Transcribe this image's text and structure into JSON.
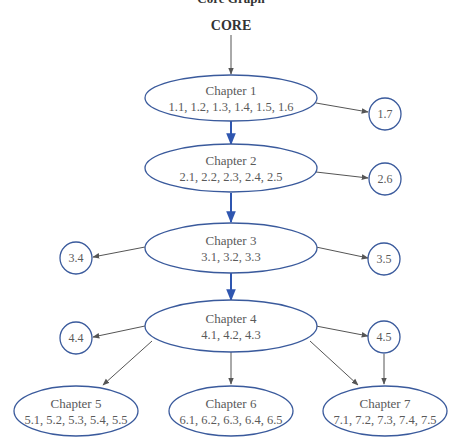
{
  "header": {
    "cutoff_title": "Core Graph",
    "core_label": "CORE"
  },
  "colors": {
    "node_stroke": "#3a5a9c",
    "core_arrow": "#2f56b0",
    "side_arrow": "#555555",
    "text": "#5a5a5a"
  },
  "chapters": [
    {
      "id": "ch1",
      "title": "Chapter 1",
      "sections": "1.1, 1.2, 1.3, 1.4, 1.5, 1.6"
    },
    {
      "id": "ch2",
      "title": "Chapter 2",
      "sections": "2.1, 2.2, 2.3, 2.4, 2.5"
    },
    {
      "id": "ch3",
      "title": "Chapter 3",
      "sections": "3.1, 3.2, 3.3"
    },
    {
      "id": "ch4",
      "title": "Chapter 4",
      "sections": "4.1, 4.2, 4.3"
    },
    {
      "id": "ch5",
      "title": "Chapter 5",
      "sections": "5.1, 5.2, 5.3, 5.4, 5.5"
    },
    {
      "id": "ch6",
      "title": "Chapter 6",
      "sections": "6.1, 6.2, 6.3, 6.4, 6.5"
    },
    {
      "id": "ch7",
      "title": "Chapter 7",
      "sections": "7.1, 7.2, 7.3, 7.4, 7.5"
    }
  ],
  "optional_sections": [
    {
      "id": "s17",
      "label": "1.7"
    },
    {
      "id": "s26",
      "label": "2.6"
    },
    {
      "id": "s34",
      "label": "3.4"
    },
    {
      "id": "s35",
      "label": "3.5"
    },
    {
      "id": "s44",
      "label": "4.4"
    },
    {
      "id": "s45",
      "label": "4.5"
    }
  ],
  "edges": [
    {
      "from": "CORE",
      "to": "Chapter 1",
      "type": "core"
    },
    {
      "from": "Chapter 1",
      "to": "Chapter 2",
      "type": "core"
    },
    {
      "from": "Chapter 2",
      "to": "Chapter 3",
      "type": "core"
    },
    {
      "from": "Chapter 3",
      "to": "Chapter 4",
      "type": "core"
    },
    {
      "from": "Chapter 1",
      "to": "1.7",
      "type": "side"
    },
    {
      "from": "Chapter 2",
      "to": "2.6",
      "type": "side"
    },
    {
      "from": "Chapter 3",
      "to": "3.4",
      "type": "side"
    },
    {
      "from": "Chapter 3",
      "to": "3.5",
      "type": "side"
    },
    {
      "from": "Chapter 4",
      "to": "4.4",
      "type": "side"
    },
    {
      "from": "Chapter 4",
      "to": "4.5",
      "type": "side"
    },
    {
      "from": "Chapter 4",
      "to": "Chapter 5",
      "type": "side"
    },
    {
      "from": "Chapter 4",
      "to": "Chapter 6",
      "type": "side"
    },
    {
      "from": "Chapter 4",
      "to": "Chapter 7",
      "type": "side"
    },
    {
      "from": "4.5",
      "to": "Chapter 7",
      "type": "side"
    }
  ]
}
